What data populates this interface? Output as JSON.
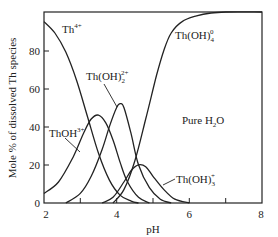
{
  "chart_data": {
    "type": "line",
    "title": "",
    "xlabel": "pH",
    "ylabel": "Mole % of dissolved Th species",
    "xlim": [
      2,
      8
    ],
    "ylim": [
      0,
      100
    ],
    "xticks": [
      2,
      3,
      4,
      5,
      6,
      7,
      8
    ],
    "xtick_labels": [
      "2",
      "",
      "4",
      "",
      "6",
      "",
      "8"
    ],
    "yticks": [
      0,
      20,
      40,
      60,
      80
    ],
    "ytick_labels": [
      "0",
      "20",
      "40",
      "60",
      "80"
    ],
    "grid": false,
    "annotations": [
      "Pure H2O"
    ],
    "series": [
      {
        "name": "Th4+",
        "label_base": "Th",
        "label_sup": "4+",
        "label_sub": "",
        "x": [
          2.0,
          2.3,
          2.6,
          2.9,
          3.2,
          3.5,
          3.8,
          4.1,
          4.4,
          4.6
        ],
        "y": [
          95,
          89,
          79,
          64,
          45,
          26,
          12,
          4,
          1,
          0
        ]
      },
      {
        "name": "ThOH3+",
        "label_base": "ThOH",
        "label_sup": "3+",
        "label_sub": "",
        "x": [
          2.0,
          2.4,
          2.8,
          3.1,
          3.3,
          3.5,
          3.7,
          3.9,
          4.1,
          4.3,
          4.6,
          4.9
        ],
        "y": [
          5,
          11,
          24,
          37,
          44,
          46,
          42,
          33,
          21,
          11,
          3,
          0
        ]
      },
      {
        "name": "Th(OH)2 2+",
        "label_base": "Th(OH)",
        "label_sup": "2+",
        "label_sub": "2",
        "x": [
          2.6,
          3.0,
          3.3,
          3.6,
          3.8,
          4.0,
          4.1,
          4.2,
          4.4,
          4.6,
          4.9,
          5.2,
          5.5
        ],
        "y": [
          0,
          5,
          14,
          28,
          40,
          50,
          52,
          50,
          36,
          20,
          8,
          2,
          0
        ]
      },
      {
        "name": "Th(OH)3 +",
        "label_base": "Th(OH)",
        "label_sup": "+",
        "label_sub": "3",
        "x": [
          3.6,
          3.9,
          4.2,
          4.4,
          4.6,
          4.8,
          5.0,
          5.3,
          5.6,
          6.0
        ],
        "y": [
          0,
          3,
          11,
          17,
          20,
          19,
          14,
          7,
          2,
          0
        ]
      },
      {
        "name": "Th(OH)4 0",
        "label_base": "Th(OH)",
        "label_sup": "0",
        "label_sub": "4",
        "x": [
          3.9,
          4.2,
          4.5,
          4.8,
          5.1,
          5.3,
          5.5,
          5.8,
          6.2,
          6.6,
          7.0,
          8.0
        ],
        "y": [
          0,
          7,
          22,
          44,
          67,
          80,
          89,
          95,
          98,
          99.5,
          100,
          100
        ]
      }
    ]
  },
  "labels": {
    "th4": {
      "base": "Th",
      "sup": "4+"
    },
    "thoh3": {
      "base": "ThOH",
      "sup": "3+"
    },
    "thoh2": {
      "base": "Th(OH)",
      "sub": "2",
      "sup": "2+"
    },
    "thoh3p": {
      "base": "Th(OH)",
      "sub": "3",
      "sup": "+"
    },
    "thoh4": {
      "base": "Th(OH)",
      "sub": "4",
      "sup": "0"
    },
    "water": {
      "base": "Pure H",
      "sub": "2",
      "tail": "O"
    }
  },
  "axes": {
    "xlabel": "pH",
    "ylabel": "Mole % of dissolved Th species",
    "xtick_labels": [
      "2",
      "4",
      "6",
      "8"
    ],
    "ytick_labels": [
      "0",
      "20",
      "40",
      "60",
      "80"
    ]
  }
}
